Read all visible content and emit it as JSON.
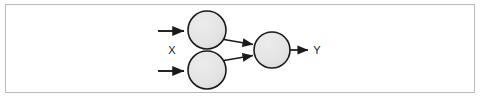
{
  "figure": {
    "kind": "neural-network-diagram",
    "frame": {
      "border_color": "#b9b9b9",
      "background_color": "#ffffff"
    },
    "style": {
      "node_fill": "#e3e3e3",
      "node_stroke": "#1a1a1a",
      "edge_color": "#1a1a1a",
      "label_color": "#1a1a1a",
      "node_stroke_width": 1.6,
      "edge_stroke_width": 1.8
    },
    "labels": {
      "input": "X",
      "output": "Y"
    },
    "nodes": [
      {
        "id": "hidden-top",
        "name": "hidden-node-top",
        "label": "",
        "cx": 207,
        "cy": 30,
        "r": 19
      },
      {
        "id": "hidden-bottom",
        "name": "hidden-node-bottom",
        "label": "",
        "cx": 207,
        "cy": 70,
        "r": 19
      },
      {
        "id": "output",
        "name": "output-node",
        "label": "",
        "cx": 272,
        "cy": 50,
        "r": 18
      }
    ],
    "edges": [
      {
        "id": "input-top",
        "name": "input-arrow-top",
        "from": "external",
        "to": "hidden-top",
        "x1": 158,
        "y1": 31,
        "x2": 186,
        "y2": 31,
        "arrow": true
      },
      {
        "id": "input-bottom",
        "name": "input-arrow-bottom",
        "from": "external",
        "to": "hidden-bottom",
        "x1": 158,
        "y1": 71,
        "x2": 186,
        "y2": 71,
        "arrow": true
      },
      {
        "id": "top-output",
        "name": "edge-top-to-output",
        "from": "hidden-top",
        "to": "output",
        "x1": 223,
        "y1": 39,
        "x2": 255,
        "y2": 45,
        "arrow": true
      },
      {
        "id": "bottom-output",
        "name": "edge-bottom-to-output",
        "from": "hidden-bottom",
        "to": "output",
        "x1": 223,
        "y1": 61,
        "x2": 255,
        "y2": 55,
        "arrow": true
      },
      {
        "id": "output-y",
        "name": "output-arrow",
        "from": "output",
        "to": "external",
        "x1": 290,
        "y1": 50,
        "x2": 310,
        "y2": 50,
        "arrow": true
      }
    ],
    "label_positions": {
      "input": {
        "x": 172,
        "y": 51
      },
      "output": {
        "x": 316,
        "y": 51
      }
    }
  }
}
